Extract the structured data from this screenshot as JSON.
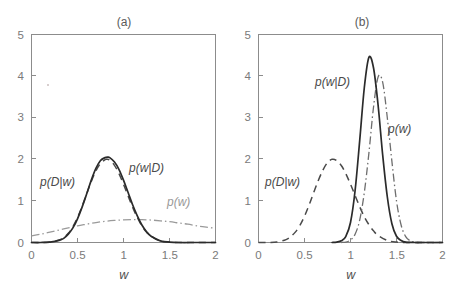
{
  "figure": {
    "background_color": "#ffffff",
    "width": 467,
    "height": 290,
    "axis_color": "#8c8c8c",
    "panels": [
      {
        "id": "a",
        "title": "(a)",
        "xlabel": "w",
        "ylabel": "",
        "xticks": [
          "0",
          "0.5",
          "1",
          "1.5",
          "2"
        ],
        "yticks": [
          "0",
          "1",
          "2",
          "3",
          "4",
          "5"
        ],
        "labels": {
          "likelihood": "p(D|w)",
          "posterior": "p(w|D)",
          "prior": "p(w)"
        }
      },
      {
        "id": "b",
        "title": "(b)",
        "xlabel": "w",
        "ylabel": "",
        "xticks": [
          "0",
          "0.5",
          "1",
          "1.5",
          "2"
        ],
        "yticks": [
          "0",
          "1",
          "2",
          "3",
          "4",
          "5"
        ],
        "labels": {
          "likelihood": "p(D|w)",
          "posterior": "p(w|D)",
          "prior": "p(w)"
        }
      }
    ]
  },
  "chart_data": [
    {
      "type": "line",
      "title": "(a)",
      "xlabel": "w",
      "ylabel": "",
      "xlim": [
        0,
        2
      ],
      "ylim": [
        0,
        5
      ],
      "xticks": [
        0,
        0.5,
        1,
        1.5,
        2
      ],
      "yticks": [
        0,
        1,
        2,
        3,
        4,
        5
      ],
      "grid": false,
      "legend": "inline-annotations",
      "series": [
        {
          "name": "p(D|w)",
          "style": "dashed",
          "color": "#4a4a4a",
          "peak_x": 0.82,
          "peak_y": 2.0,
          "description": "likelihood, broad gaussian centered near w=0.82 with sigma about 0.2",
          "x": [
            0.0,
            0.1,
            0.2,
            0.3,
            0.35,
            0.4,
            0.45,
            0.5,
            0.55,
            0.6,
            0.65,
            0.7,
            0.75,
            0.8,
            0.82,
            0.85,
            0.9,
            0.95,
            1.0,
            1.05,
            1.1,
            1.15,
            1.2,
            1.25,
            1.3,
            1.4,
            1.5,
            1.6,
            1.8,
            2.0
          ],
          "y": [
            0.0,
            0.0,
            0.01,
            0.06,
            0.12,
            0.22,
            0.38,
            0.6,
            0.87,
            1.17,
            1.47,
            1.72,
            1.9,
            1.99,
            2.0,
            1.98,
            1.86,
            1.66,
            1.4,
            1.12,
            0.84,
            0.6,
            0.4,
            0.25,
            0.15,
            0.04,
            0.01,
            0.0,
            0.0,
            0.0
          ]
        },
        {
          "name": "p(w|D)",
          "style": "solid",
          "color": "#2b2b2b",
          "peak_x": 0.83,
          "peak_y": 2.05,
          "description": "posterior, nearly identical to likelihood because prior is broad and flat",
          "x": [
            0.0,
            0.1,
            0.2,
            0.3,
            0.35,
            0.4,
            0.45,
            0.5,
            0.55,
            0.6,
            0.65,
            0.7,
            0.75,
            0.8,
            0.83,
            0.85,
            0.9,
            0.95,
            1.0,
            1.05,
            1.1,
            1.15,
            1.2,
            1.25,
            1.3,
            1.4,
            1.5,
            1.6,
            1.8,
            2.0
          ],
          "y": [
            0.0,
            0.0,
            0.01,
            0.05,
            0.1,
            0.2,
            0.35,
            0.57,
            0.85,
            1.17,
            1.5,
            1.78,
            1.97,
            2.04,
            2.05,
            2.04,
            1.94,
            1.76,
            1.5,
            1.2,
            0.9,
            0.64,
            0.42,
            0.26,
            0.15,
            0.04,
            0.01,
            0.0,
            0.0,
            0.0
          ]
        },
        {
          "name": "p(w)",
          "style": "dash-dot",
          "color": "#9a9a9a",
          "peak_x": 1.2,
          "peak_y": 0.55,
          "description": "prior, very broad and nearly flat gaussian centered near w=1.2 with large sigma",
          "x": [
            0.0,
            0.1,
            0.2,
            0.3,
            0.4,
            0.5,
            0.6,
            0.7,
            0.8,
            0.9,
            1.0,
            1.1,
            1.2,
            1.3,
            1.4,
            1.5,
            1.6,
            1.7,
            1.8,
            1.9,
            2.0
          ],
          "y": [
            0.16,
            0.2,
            0.25,
            0.3,
            0.35,
            0.4,
            0.44,
            0.48,
            0.51,
            0.53,
            0.545,
            0.55,
            0.55,
            0.54,
            0.52,
            0.5,
            0.47,
            0.44,
            0.4,
            0.37,
            0.34
          ]
        }
      ]
    },
    {
      "type": "line",
      "title": "(b)",
      "xlabel": "w",
      "ylabel": "",
      "xlim": [
        0,
        2
      ],
      "ylim": [
        0,
        5
      ],
      "xticks": [
        0,
        0.5,
        1,
        1.5,
        2
      ],
      "yticks": [
        0,
        1,
        2,
        3,
        4,
        5
      ],
      "grid": false,
      "legend": "inline-annotations",
      "series": [
        {
          "name": "p(D|w)",
          "style": "dashed",
          "color": "#4a4a4a",
          "peak_x": 0.8,
          "peak_y": 2.0,
          "description": "likelihood, broad gaussian centered near w=0.8",
          "x": [
            0.0,
            0.1,
            0.2,
            0.3,
            0.35,
            0.4,
            0.45,
            0.5,
            0.55,
            0.6,
            0.65,
            0.7,
            0.75,
            0.8,
            0.85,
            0.9,
            0.95,
            1.0,
            1.05,
            1.1,
            1.15,
            1.2,
            1.25,
            1.3,
            1.4,
            1.5,
            1.6,
            1.8,
            2.0
          ],
          "y": [
            0.0,
            0.0,
            0.01,
            0.07,
            0.14,
            0.25,
            0.41,
            0.63,
            0.9,
            1.2,
            1.49,
            1.74,
            1.92,
            2.0,
            1.97,
            1.85,
            1.65,
            1.4,
            1.13,
            0.86,
            0.62,
            0.43,
            0.28,
            0.17,
            0.05,
            0.01,
            0.0,
            0.0,
            0.0
          ]
        },
        {
          "name": "p(w)",
          "style": "dash-dot",
          "color": "#6e6e6e",
          "peak_x": 1.3,
          "peak_y": 3.98,
          "description": "prior, narrow gaussian centered near w=1.3 with sigma about 0.1",
          "x": [
            0.9,
            0.95,
            1.0,
            1.05,
            1.1,
            1.15,
            1.2,
            1.25,
            1.3,
            1.35,
            1.4,
            1.45,
            1.5,
            1.55,
            1.6,
            1.65,
            1.7,
            1.8,
            2.0
          ],
          "y": [
            0.0,
            0.01,
            0.06,
            0.2,
            0.54,
            1.2,
            2.15,
            3.25,
            3.98,
            3.85,
            3.0,
            1.95,
            1.0,
            0.42,
            0.14,
            0.04,
            0.01,
            0.0,
            0.0
          ]
        },
        {
          "name": "p(w|D)",
          "style": "solid",
          "color": "#2b2b2b",
          "peak_x": 1.2,
          "peak_y": 4.45,
          "description": "posterior, narrow gaussian between likelihood and prior, centered near w=1.2",
          "x": [
            0.8,
            0.85,
            0.9,
            0.95,
            1.0,
            1.05,
            1.1,
            1.15,
            1.2,
            1.25,
            1.3,
            1.35,
            1.4,
            1.45,
            1.5,
            1.55,
            1.6,
            1.7,
            1.8,
            2.0
          ],
          "y": [
            0.0,
            0.01,
            0.04,
            0.15,
            0.48,
            1.25,
            2.45,
            3.72,
            4.45,
            4.2,
            3.3,
            2.1,
            1.1,
            0.45,
            0.15,
            0.05,
            0.01,
            0.0,
            0.0,
            0.0
          ]
        }
      ]
    }
  ]
}
